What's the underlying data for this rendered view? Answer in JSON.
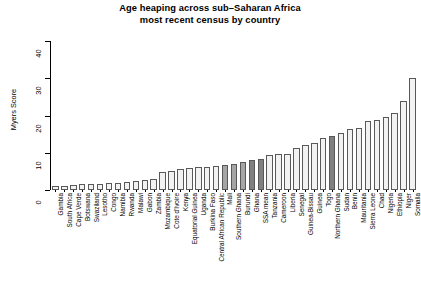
{
  "chart_data": {
    "type": "bar",
    "title_line1": "Age heaping across sub–Saharan Africa",
    "title_line2": "most recent census by country",
    "xlabel": "",
    "ylabel": "Myers Score",
    "ylim": [
      0,
      40
    ],
    "yticks": [
      0,
      10,
      20,
      30,
      40
    ],
    "grid": false,
    "legend": false,
    "bar_fill_open": "#f2f2f2",
    "bar_fill_mid": "#a6a6a6",
    "bar_fill_dark": "#808080",
    "bar_border": "#595959",
    "categories": [
      "Gambia",
      "South Africa",
      "Cape Verde",
      "Botswana",
      "Swaziland",
      "Lesotho",
      "Congo",
      "Namibia",
      "Rwanda",
      "Malawi",
      "Gabon",
      "Zambia",
      "Mozambique",
      "Cote d'Ivoire",
      "Kenya",
      "Equatorial Guinea",
      "Uganda",
      "Burkina Faso",
      "Central African Republic",
      "Mali",
      "Southern Ghana",
      "Burundi",
      "Ghana",
      "SSA mean",
      "Tanzania",
      "Cameroon",
      "Liberia",
      "Senegal",
      "Guinea-Bissau",
      "Guinea",
      "Togo",
      "Northern Ghana",
      "Sudan",
      "Benin",
      "Mauritania",
      "Sierra Leone",
      "Chad",
      "Nigeria",
      "Ethiopia",
      "Niger",
      "Somalia"
    ],
    "values": [
      1.0,
      1.2,
      1.3,
      1.5,
      1.6,
      1.7,
      1.8,
      2.0,
      2.1,
      2.3,
      2.6,
      3.0,
      4.8,
      5.2,
      5.7,
      6.0,
      6.3,
      6.2,
      6.4,
      6.6,
      7.0,
      7.6,
      8.0,
      8.2,
      9.5,
      9.6,
      9.7,
      11.3,
      12.0,
      12.6,
      13.9,
      14.6,
      15.3,
      16.3,
      16.6,
      18.4,
      18.8,
      19.6,
      20.8,
      24.0,
      30.2
    ],
    "shading": [
      "open",
      "open",
      "open",
      "open",
      "open",
      "open",
      "open",
      "open",
      "open",
      "open",
      "open",
      "open",
      "open",
      "open",
      "open",
      "open",
      "open",
      "open",
      "open",
      "mid",
      "mid",
      "mid",
      "dark",
      "dark",
      "open",
      "open",
      "open",
      "open",
      "open",
      "open",
      "open",
      "dark",
      "open",
      "open",
      "open",
      "open",
      "open",
      "open",
      "open",
      "open",
      "open"
    ]
  }
}
